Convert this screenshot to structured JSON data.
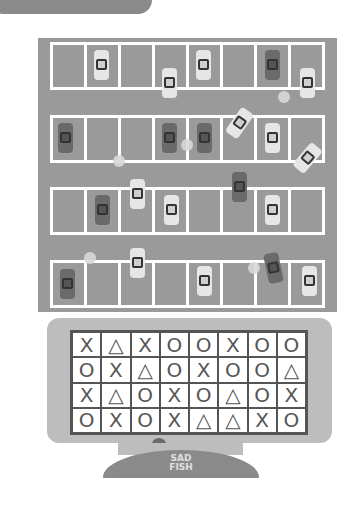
{
  "header": {
    "tab_label": ""
  },
  "parking_lot": {
    "rows": 4,
    "stalls_per_row": 8,
    "colors": {
      "asphalt": "#9a9a9a",
      "lines": "#ffffff",
      "car_light": "#e6e6e6",
      "car_dark": "#6a6a6a"
    },
    "cars": [
      {
        "row": 0,
        "stall": 1,
        "tone": "light"
      },
      {
        "row": 0,
        "stall": 4,
        "tone": "light"
      },
      {
        "row": 0,
        "stall": 6,
        "tone": "dark"
      },
      {
        "row": 1,
        "stall": 0,
        "tone": "dark"
      },
      {
        "row": 1,
        "stall": 3,
        "tone": "dark"
      },
      {
        "row": 1,
        "stall": 4,
        "tone": "dark"
      },
      {
        "row": 1,
        "stall": 6,
        "tone": "light"
      },
      {
        "row": 2,
        "stall": 1,
        "tone": "dark"
      },
      {
        "row": 2,
        "stall": 3,
        "tone": "light"
      },
      {
        "row": 2,
        "stall": 6,
        "tone": "light"
      },
      {
        "row": 3,
        "stall": 0,
        "tone": "dark"
      },
      {
        "row": 3,
        "stall": 4,
        "tone": "light"
      },
      {
        "row": 3,
        "stall": 7,
        "tone": "light"
      }
    ]
  },
  "monitor": {
    "grid": [
      [
        "X",
        "△",
        "X",
        "O",
        "O",
        "X",
        "O",
        "O"
      ],
      [
        "O",
        "X",
        "△",
        "O",
        "X",
        "O",
        "O",
        "△"
      ],
      [
        "X",
        "△",
        "O",
        "X",
        "O",
        "△",
        "O",
        "X"
      ],
      [
        "O",
        "X",
        "O",
        "X",
        "△",
        "△",
        "X",
        "O"
      ]
    ],
    "logo_line1": "SAD",
    "logo_line2": "FISH"
  }
}
